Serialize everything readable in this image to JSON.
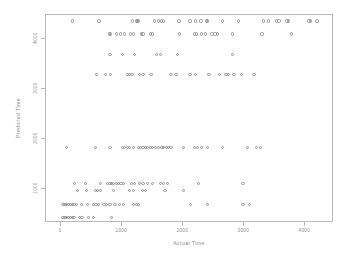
{
  "chart_data": {
    "type": "scatter",
    "title": "",
    "xlabel": "Actual Time",
    "ylabel": "Predicted Time",
    "xlim": [
      -250,
      4470
    ],
    "ylim": [
      330,
      4480
    ],
    "grid": false,
    "legend": null,
    "xticks": [
      0,
      1000,
      2000,
      3000,
      4000
    ],
    "xtick_labels": [
      "0",
      "1000",
      "2000",
      "3000",
      "4000"
    ],
    "yticks": [
      1000,
      2000,
      3000,
      4000
    ],
    "ytick_labels": [
      "1000",
      "2000",
      "3000",
      "4000"
    ],
    "marker": "open-circle",
    "marker_color": "#7e7e7e",
    "series": [
      {
        "name": "predicted vs actual",
        "points": [
          [
            180,
            4360
          ],
          [
            620,
            4360
          ],
          [
            1170,
            4360
          ],
          [
            1230,
            4360
          ],
          [
            1250,
            4360
          ],
          [
            1270,
            4360
          ],
          [
            1530,
            4360
          ],
          [
            1600,
            4360
          ],
          [
            1640,
            4360
          ],
          [
            1680,
            4360
          ],
          [
            1930,
            4360
          ],
          [
            2110,
            4360
          ],
          [
            2200,
            4360
          ],
          [
            2290,
            4360
          ],
          [
            2380,
            4360
          ],
          [
            2400,
            4360
          ],
          [
            2640,
            4360
          ],
          [
            2900,
            4360
          ],
          [
            3320,
            4360
          ],
          [
            3400,
            4360
          ],
          [
            3530,
            4360
          ],
          [
            3570,
            4360
          ],
          [
            3700,
            4360
          ],
          [
            3730,
            4360
          ],
          [
            4060,
            4360
          ],
          [
            4090,
            4360
          ],
          [
            4190,
            4360
          ],
          [
            790,
            4100
          ],
          [
            810,
            4100
          ],
          [
            900,
            4100
          ],
          [
            970,
            4100
          ],
          [
            1040,
            4100
          ],
          [
            1140,
            4100
          ],
          [
            1180,
            4100
          ],
          [
            1310,
            4100
          ],
          [
            1340,
            4100
          ],
          [
            1460,
            4100
          ],
          [
            1500,
            4100
          ],
          [
            1940,
            4100
          ],
          [
            2190,
            4100
          ],
          [
            2220,
            4100
          ],
          [
            2300,
            4100
          ],
          [
            2370,
            4100
          ],
          [
            2470,
            4100
          ],
          [
            2520,
            4100
          ],
          [
            2560,
            4100
          ],
          [
            2800,
            4100
          ],
          [
            3290,
            4100
          ],
          [
            3780,
            4100
          ],
          [
            800,
            3700
          ],
          [
            1000,
            3700
          ],
          [
            1200,
            3700
          ],
          [
            1560,
            3700
          ],
          [
            1620,
            3700
          ],
          [
            1900,
            3700
          ],
          [
            2800,
            3700
          ],
          [
            580,
            3300
          ],
          [
            720,
            3300
          ],
          [
            810,
            3300
          ],
          [
            1080,
            3300
          ],
          [
            1120,
            3300
          ],
          [
            1160,
            3300
          ],
          [
            1280,
            3300
          ],
          [
            1340,
            3300
          ],
          [
            1470,
            3300
          ],
          [
            1800,
            3300
          ],
          [
            1880,
            3300
          ],
          [
            2110,
            3300
          ],
          [
            2200,
            3300
          ],
          [
            2420,
            3300
          ],
          [
            2600,
            3300
          ],
          [
            2700,
            3300
          ],
          [
            2740,
            3300
          ],
          [
            2830,
            3300
          ],
          [
            2950,
            3300
          ],
          [
            3160,
            3300
          ],
          [
            80,
            1830
          ],
          [
            560,
            1830
          ],
          [
            800,
            1830
          ],
          [
            1000,
            1830
          ],
          [
            1040,
            1830
          ],
          [
            1080,
            1830
          ],
          [
            1120,
            1830
          ],
          [
            1180,
            1830
          ],
          [
            1260,
            1830
          ],
          [
            1300,
            1830
          ],
          [
            1340,
            1830
          ],
          [
            1380,
            1830
          ],
          [
            1420,
            1830
          ],
          [
            1460,
            1830
          ],
          [
            1500,
            1830
          ],
          [
            1540,
            1830
          ],
          [
            1600,
            1830
          ],
          [
            1650,
            1830
          ],
          [
            1680,
            1830
          ],
          [
            1720,
            1830
          ],
          [
            1760,
            1830
          ],
          [
            1800,
            1830
          ],
          [
            2000,
            1830
          ],
          [
            2180,
            1830
          ],
          [
            2230,
            1830
          ],
          [
            2300,
            1830
          ],
          [
            2400,
            1830
          ],
          [
            2640,
            1830
          ],
          [
            3050,
            1830
          ],
          [
            3200,
            1830
          ],
          [
            3260,
            1830
          ],
          [
            220,
            1120
          ],
          [
            400,
            1120
          ],
          [
            640,
            1120
          ],
          [
            760,
            1120
          ],
          [
            800,
            1120
          ],
          [
            830,
            1120
          ],
          [
            860,
            1120
          ],
          [
            900,
            1120
          ],
          [
            940,
            1120
          ],
          [
            980,
            1120
          ],
          [
            1020,
            1120
          ],
          [
            1150,
            1120
          ],
          [
            1200,
            1120
          ],
          [
            1280,
            1120
          ],
          [
            1340,
            1120
          ],
          [
            1420,
            1120
          ],
          [
            1500,
            1120
          ],
          [
            1620,
            1120
          ],
          [
            1680,
            1120
          ],
          [
            1740,
            1120
          ],
          [
            2250,
            1120
          ],
          [
            2980,
            1120
          ],
          [
            260,
            980
          ],
          [
            420,
            980
          ],
          [
            560,
            980
          ],
          [
            600,
            980
          ],
          [
            640,
            980
          ],
          [
            850,
            980
          ],
          [
            1120,
            980
          ],
          [
            1180,
            980
          ],
          [
            1330,
            980
          ],
          [
            1380,
            980
          ],
          [
            1700,
            980
          ],
          [
            2000,
            980
          ],
          [
            30,
            700
          ],
          [
            60,
            700
          ],
          [
            90,
            700
          ],
          [
            120,
            700
          ],
          [
            150,
            700
          ],
          [
            180,
            700
          ],
          [
            210,
            700
          ],
          [
            250,
            700
          ],
          [
            330,
            700
          ],
          [
            430,
            700
          ],
          [
            530,
            700
          ],
          [
            570,
            700
          ],
          [
            610,
            700
          ],
          [
            700,
            700
          ],
          [
            740,
            700
          ],
          [
            800,
            700
          ],
          [
            880,
            700
          ],
          [
            950,
            700
          ],
          [
            1020,
            700
          ],
          [
            1180,
            700
          ],
          [
            1230,
            700
          ],
          [
            1260,
            700
          ],
          [
            2120,
            700
          ],
          [
            2400,
            700
          ],
          [
            2980,
            700
          ],
          [
            3080,
            700
          ],
          [
            30,
            440
          ],
          [
            60,
            440
          ],
          [
            90,
            440
          ],
          [
            120,
            440
          ],
          [
            150,
            440
          ],
          [
            180,
            440
          ],
          [
            210,
            440
          ],
          [
            300,
            440
          ],
          [
            340,
            440
          ],
          [
            450,
            440
          ],
          [
            530,
            440
          ],
          [
            820,
            440
          ]
        ]
      }
    ]
  }
}
